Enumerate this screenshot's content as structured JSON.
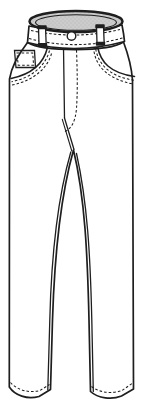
{
  "figure": {
    "garment": "trousers",
    "view": "front",
    "parts": [
      "waist-opening",
      "waistband",
      "belt-loop-left",
      "belt-loop-right",
      "waistband-button",
      "fly-center-line",
      "fly-j-stitch",
      "coin-pocket",
      "front-pocket-left",
      "front-pocket-right",
      "leg-left",
      "leg-right",
      "hem-left",
      "hem-right"
    ],
    "colors": {
      "line": "#1e1e1e",
      "fill": "#ffffff",
      "waist_opening_fill": "#cccccc",
      "waist_opening_dot": "#b3b3b3",
      "background": "#ffffff"
    }
  }
}
